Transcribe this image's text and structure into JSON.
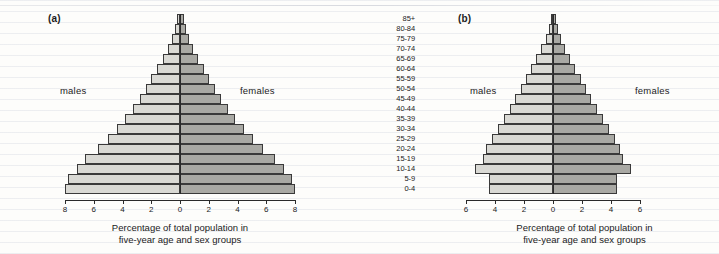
{
  "figure": {
    "panels": [
      {
        "id": "a",
        "label": "(a)",
        "male_label": "males",
        "female_label": "females",
        "caption_line1": "Percentage of total population in",
        "caption_line2": "five-year age and sex groups"
      },
      {
        "id": "b",
        "label": "(b)",
        "male_label": "males",
        "female_label": "females",
        "caption_line1": "Percentage of total population in",
        "caption_line2": "five-year age and sex groups"
      }
    ],
    "age_groups": [
      "85+",
      "80-84",
      "75-79",
      "70-74",
      "65-69",
      "60-64",
      "55-59",
      "50-54",
      "45-49",
      "40-44",
      "35-39",
      "30-34",
      "25-29",
      "20-24",
      "15-19",
      "10-14",
      "5-9",
      "0-4"
    ],
    "colors": {
      "male_bar": "#d9d9d4",
      "female_bar": "#a9a9a4",
      "bar_outline": "#3a3a3a",
      "axis": "#2a2a2a",
      "paper": "#fdfdfb",
      "rule_line": "#96a0b9"
    }
  },
  "chart_data": [
    {
      "type": "bar",
      "subtype": "population-pyramid",
      "panel": "a",
      "title": "(a)",
      "xlabel": "Percentage of total population in five-year age and sex groups",
      "ylabel": "",
      "categories": [
        "85+",
        "80-84",
        "75-79",
        "70-74",
        "65-69",
        "60-64",
        "55-59",
        "50-54",
        "45-49",
        "40-44",
        "35-39",
        "30-34",
        "25-29",
        "20-24",
        "15-19",
        "10-14",
        "5-9",
        "0-4"
      ],
      "xlim": [
        -8,
        8
      ],
      "xticks": [
        8,
        6,
        4,
        2,
        0,
        2,
        4,
        6,
        8
      ],
      "xtick_labels": [
        "8",
        "6",
        "4",
        "2",
        "0",
        "2",
        "4",
        "6",
        "8"
      ],
      "grid": false,
      "legend": [
        "males",
        "females"
      ],
      "legend_position": "inside-left-and-right",
      "series": [
        {
          "name": "males",
          "values": [
            0.2,
            0.35,
            0.55,
            0.85,
            1.2,
            1.6,
            2.0,
            2.4,
            2.8,
            3.3,
            3.8,
            4.4,
            5.0,
            5.7,
            6.6,
            7.2,
            7.8,
            8.0
          ]
        },
        {
          "name": "females",
          "values": [
            0.25,
            0.4,
            0.6,
            0.9,
            1.25,
            1.65,
            2.05,
            2.45,
            2.85,
            3.35,
            3.85,
            4.45,
            5.05,
            5.75,
            6.6,
            7.2,
            7.8,
            8.0
          ]
        }
      ]
    },
    {
      "type": "bar",
      "subtype": "population-pyramid",
      "panel": "b",
      "title": "(b)",
      "xlabel": "Percentage of total population in five-year age and sex groups",
      "ylabel": "",
      "categories": [
        "85+",
        "80-84",
        "75-79",
        "70-74",
        "65-69",
        "60-64",
        "55-59",
        "50-54",
        "45-49",
        "40-44",
        "35-39",
        "30-34",
        "25-29",
        "20-24",
        "15-19",
        "10-14",
        "5-9",
        "0-4"
      ],
      "xlim": [
        -6,
        6
      ],
      "xticks": [
        6,
        4,
        2,
        0,
        2,
        4,
        6
      ],
      "xtick_labels": [
        "6",
        "4",
        "2",
        "0",
        "2",
        "4",
        "6"
      ],
      "grid": false,
      "legend": [
        "males",
        "females"
      ],
      "legend_position": "inside-left-and-right",
      "series": [
        {
          "name": "males",
          "values": [
            0.15,
            0.3,
            0.5,
            0.8,
            1.15,
            1.5,
            1.85,
            2.2,
            2.6,
            3.0,
            3.4,
            3.8,
            4.2,
            4.6,
            4.8,
            5.4,
            4.4,
            4.4
          ]
        },
        {
          "name": "females",
          "values": [
            0.2,
            0.35,
            0.55,
            0.85,
            1.2,
            1.55,
            1.9,
            2.25,
            2.65,
            3.05,
            3.45,
            3.85,
            4.25,
            4.65,
            4.85,
            5.4,
            4.4,
            4.4
          ]
        }
      ]
    }
  ]
}
